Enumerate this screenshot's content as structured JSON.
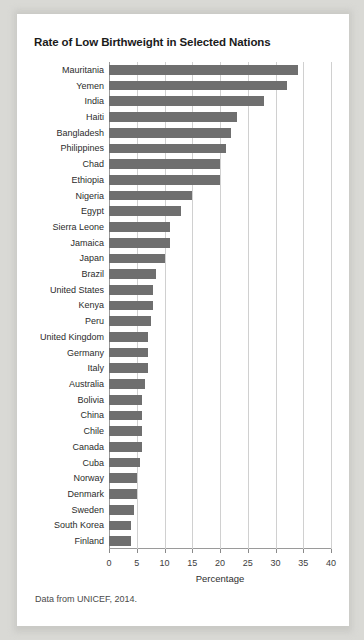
{
  "figure": {
    "title": "Rate of Low Birthweight in Selected Nations",
    "caption": "Data from UNICEF, 2014."
  },
  "chart_data": {
    "type": "bar",
    "orientation": "horizontal",
    "title": "Rate of Low Birthweight in Selected Nations",
    "xlabel": "Percentage",
    "ylabel": "",
    "xlim": [
      0,
      40
    ],
    "xticks": [
      0,
      5,
      10,
      15,
      20,
      25,
      30,
      35,
      40
    ],
    "xticklabels": [
      "0",
      "5",
      "10",
      "15",
      "20",
      "25",
      "30",
      "35",
      "40"
    ],
    "grid": "vertical",
    "legend": "none",
    "bar_color": "#6f6f6f",
    "categories": [
      "Mauritania",
      "Yemen",
      "India",
      "Haiti",
      "Bangladesh",
      "Philippines",
      "Chad",
      "Ethiopia",
      "Nigeria",
      "Egypt",
      "Sierra Leone",
      "Jamaica",
      "Japan",
      "Brazil",
      "United States",
      "Kenya",
      "Peru",
      "United Kingdom",
      "Germany",
      "Italy",
      "Australia",
      "Bolivia",
      "China",
      "Chile",
      "Canada",
      "Cuba",
      "Norway",
      "Denmark",
      "Sweden",
      "South Korea",
      "Finland"
    ],
    "values": [
      34.0,
      32.0,
      28.0,
      23.0,
      22.0,
      21.0,
      20.0,
      20.0,
      15.0,
      13.0,
      11.0,
      11.0,
      10.0,
      8.5,
      8.0,
      8.0,
      7.5,
      7.0,
      7.0,
      7.0,
      6.5,
      6.0,
      6.0,
      6.0,
      6.0,
      5.5,
      5.0,
      5.0,
      4.5,
      4.0,
      4.0
    ],
    "units": "percent"
  },
  "axis": {
    "x_title": "Percentage"
  }
}
